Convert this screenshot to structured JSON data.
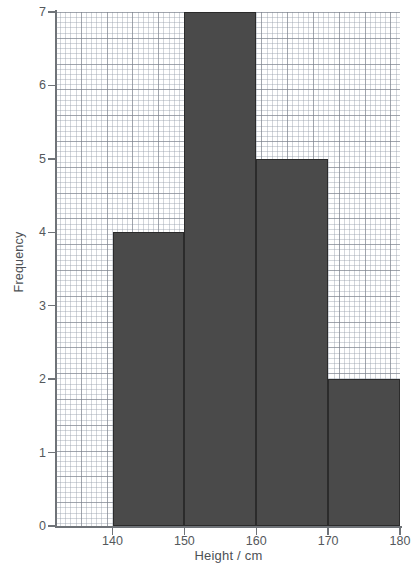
{
  "chart_data": {
    "type": "bar",
    "title": "",
    "subtitle": "",
    "xlabel": "Height / cm",
    "ylabel": "Frequency",
    "categories": [
      "140-150",
      "150-160",
      "160-170",
      "170-180"
    ],
    "bin_edges": [
      140,
      150,
      160,
      170,
      180
    ],
    "values": [
      4,
      7,
      5,
      2
    ],
    "xlim": [
      132,
      180
    ],
    "ylim": [
      0,
      7
    ],
    "xticks": [
      140,
      150,
      160,
      170,
      180
    ],
    "yticks": [
      0,
      1,
      2,
      3,
      4,
      5,
      6,
      7
    ],
    "grid": true,
    "grid_style": "graph-paper-minor-and-major",
    "legend": "none",
    "bar_color": "#4a4a4a",
    "bar_edge_color": "#2b2b2b",
    "axis_color": "#6f7378",
    "background": "#ffffff"
  },
  "axes": {
    "y_title": "Frequency",
    "x_title": "Height / cm",
    "y_tick_labels": [
      "0",
      "1",
      "2",
      "3",
      "4",
      "5",
      "6",
      "7"
    ],
    "x_tick_labels": [
      "140",
      "150",
      "160",
      "170",
      "180"
    ]
  }
}
